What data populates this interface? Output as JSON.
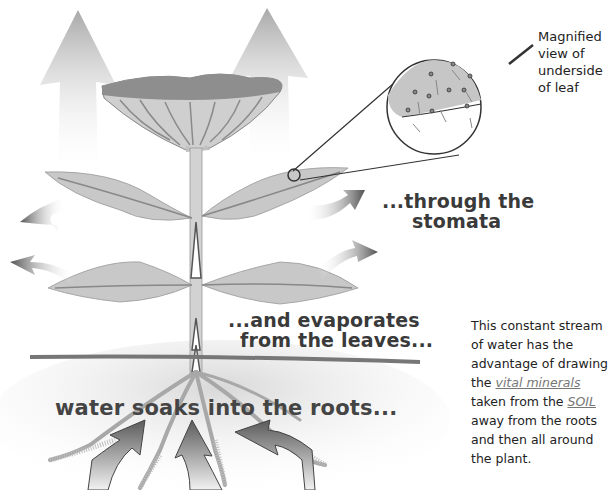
{
  "diagram": {
    "title_partial": "... by ___ p...",
    "labels": {
      "roots": "water soaks into the roots...",
      "evaporates_line1": "...and evaporates",
      "evaporates_line2": "from the leaves...",
      "stomata_line1": "...through the",
      "stomata_line2": "stomata",
      "magnified_line1": "Magnified",
      "magnified_line2": "view of",
      "magnified_line3": "underside",
      "magnified_line4": "of leaf"
    },
    "paragraph": {
      "part1": "This constant stream of water has the advantage of drawing the ",
      "vital_minerals": "vital minerals",
      "part2": " taken from the ",
      "soil": "SOIL",
      "part3": " away from the roots and then all around the plant."
    },
    "components": [
      "flower",
      "stem",
      "upper-leaves",
      "lower-leaves",
      "roots",
      "soil-line",
      "vapor-arrows",
      "water-intake-arrows",
      "magnifier-circle",
      "stomata"
    ],
    "colors": {
      "leaf": "#c8c8c8",
      "leaf_vein": "#8a8a8a",
      "flower_top": "#8e8e8e",
      "arrow_dark": "#555555",
      "arrow_light": "#e8e8e8",
      "text": "#3a3a3a"
    }
  }
}
